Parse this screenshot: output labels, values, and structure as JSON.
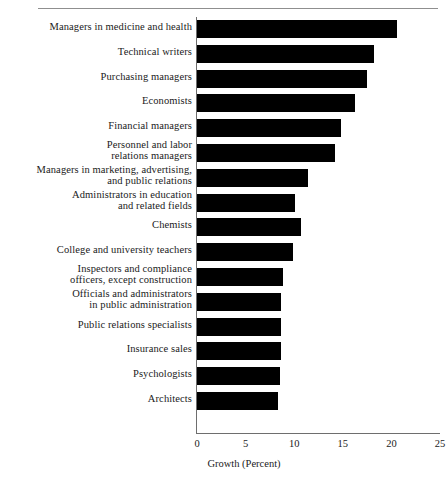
{
  "figure": {
    "has_top_rule": true,
    "background": "#ffffff",
    "bar_color": "#000000",
    "axis_color": "#6e6e6e",
    "text_color": "#1a1a1a"
  },
  "axis": {
    "xlabel": "Growth (Percent)",
    "ticks": [
      "0",
      "5",
      "10",
      "15",
      "20",
      "25"
    ],
    "tick_values": [
      0,
      5,
      10,
      15,
      20,
      25
    ]
  },
  "chart_data": {
    "type": "bar",
    "orientation": "horizontal",
    "title": "",
    "xlabel": "Growth (Percent)",
    "ylabel": "",
    "xlim": [
      0,
      25
    ],
    "xticks": [
      0,
      5,
      10,
      15,
      20,
      25
    ],
    "grid": false,
    "legend": null,
    "categories": [
      "Managers in medicine and health",
      "Technical writers",
      "Purchasing managers",
      "Economists",
      "Financial managers",
      "Personnel and labor\nrelations managers",
      "Managers in marketing, advertising,\nand public relations",
      "Administrators in education\nand related fields",
      "Chemists",
      "College and university teachers",
      "Inspectors and compliance\nofficers, except construction",
      "Officials and administrators\nin public administration",
      "Public relations specialists",
      "Insurance sales",
      "Psychologists",
      "Architects"
    ],
    "values": [
      20.6,
      18.2,
      17.5,
      16.3,
      14.8,
      14.2,
      11.4,
      10.1,
      10.7,
      9.9,
      8.8,
      8.6,
      8.6,
      8.6,
      8.5,
      8.3
    ]
  }
}
